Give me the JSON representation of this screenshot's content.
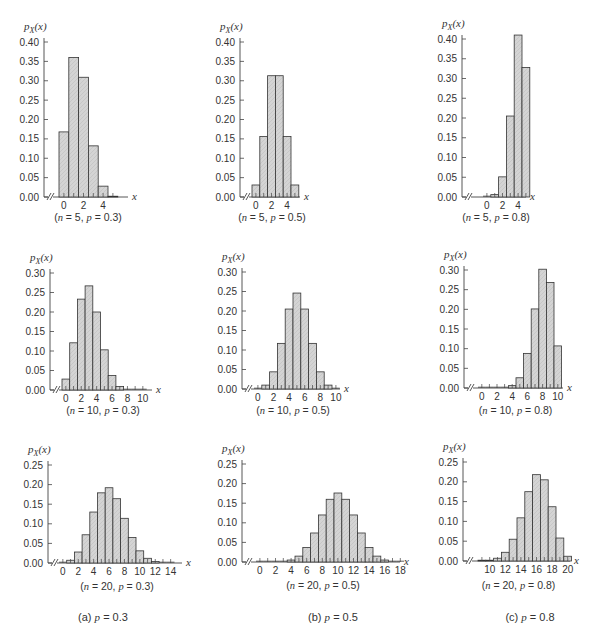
{
  "figure": {
    "y_axis_label": "p_X(x)",
    "x_axis_label": "x",
    "column_captions": [
      "(a) p = 0.3",
      "(b) p = 0.5",
      "(c) p = 0.8"
    ]
  },
  "chart_data": [
    {
      "type": "bar",
      "title": "(n = 5, p = 0.3)",
      "n": 5,
      "p": 0.3,
      "xlabel": "x",
      "ylabel": "p_X(x)",
      "ylim": [
        0,
        0.4
      ],
      "yticks": [
        0,
        0.05,
        0.1,
        0.15,
        0.2,
        0.25,
        0.3,
        0.35,
        0.4
      ],
      "xticks": [
        0,
        2,
        4
      ],
      "x": [
        0,
        1,
        2,
        3,
        4,
        5
      ],
      "values": [
        0.168,
        0.36,
        0.309,
        0.132,
        0.028,
        0.002
      ]
    },
    {
      "type": "bar",
      "title": "(n = 5, p = 0.5)",
      "n": 5,
      "p": 0.5,
      "xlabel": "x",
      "ylabel": "p_X(x)",
      "ylim": [
        0,
        0.4
      ],
      "yticks": [
        0,
        0.05,
        0.1,
        0.15,
        0.2,
        0.25,
        0.3,
        0.35,
        0.4
      ],
      "xticks": [
        0,
        2,
        4
      ],
      "x": [
        0,
        1,
        2,
        3,
        4,
        5
      ],
      "values": [
        0.031,
        0.156,
        0.313,
        0.313,
        0.156,
        0.031
      ]
    },
    {
      "type": "bar",
      "title": "(n = 5, p = 0.8)",
      "n": 5,
      "p": 0.8,
      "xlabel": "x",
      "ylabel": "p_X(x)",
      "ylim": [
        0,
        0.4
      ],
      "yticks": [
        0,
        0.05,
        0.1,
        0.15,
        0.2,
        0.25,
        0.3,
        0.35,
        0.4
      ],
      "xticks": [
        0,
        2,
        4
      ],
      "x": [
        0,
        1,
        2,
        3,
        4,
        5
      ],
      "values": [
        0.0,
        0.006,
        0.051,
        0.205,
        0.41,
        0.328
      ]
    },
    {
      "type": "bar",
      "title": "(n = 10, p = 0.3)",
      "n": 10,
      "p": 0.3,
      "xlabel": "x",
      "ylabel": "p_X(x)",
      "ylim": [
        0,
        0.3
      ],
      "yticks": [
        0,
        0.05,
        0.1,
        0.15,
        0.2,
        0.25,
        0.3
      ],
      "xticks": [
        0,
        2,
        4,
        6,
        8,
        10
      ],
      "x": [
        0,
        1,
        2,
        3,
        4,
        5,
        6,
        7,
        8,
        9,
        10
      ],
      "values": [
        0.028,
        0.121,
        0.233,
        0.267,
        0.2,
        0.103,
        0.037,
        0.009,
        0.001,
        0.0,
        0.0
      ]
    },
    {
      "type": "bar",
      "title": "(n = 10, p = 0.5)",
      "n": 10,
      "p": 0.5,
      "xlabel": "x",
      "ylabel": "p_X(x)",
      "ylim": [
        0,
        0.3
      ],
      "yticks": [
        0,
        0.05,
        0.1,
        0.15,
        0.2,
        0.25,
        0.3
      ],
      "xticks": [
        0,
        2,
        4,
        6,
        8,
        10
      ],
      "x": [
        0,
        1,
        2,
        3,
        4,
        5,
        6,
        7,
        8,
        9,
        10
      ],
      "values": [
        0.001,
        0.01,
        0.044,
        0.117,
        0.205,
        0.246,
        0.205,
        0.117,
        0.044,
        0.01,
        0.001
      ]
    },
    {
      "type": "bar",
      "title": "(n = 10, p = 0.8)",
      "n": 10,
      "p": 0.8,
      "xlabel": "x",
      "ylabel": "p_X(x)",
      "ylim": [
        0,
        0.3
      ],
      "yticks": [
        0,
        0.05,
        0.1,
        0.15,
        0.2,
        0.25,
        0.3
      ],
      "xticks": [
        0,
        2,
        4,
        6,
        8,
        10
      ],
      "x": [
        0,
        1,
        2,
        3,
        4,
        5,
        6,
        7,
        8,
        9,
        10
      ],
      "values": [
        0.0,
        0.0,
        0.0,
        0.001,
        0.006,
        0.026,
        0.088,
        0.201,
        0.302,
        0.268,
        0.107
      ]
    },
    {
      "type": "bar",
      "title": "(n = 20, p = 0.3)",
      "n": 20,
      "p": 0.3,
      "xlabel": "x",
      "ylabel": "p_X(x)",
      "ylim": [
        0,
        0.25
      ],
      "yticks": [
        0,
        0.05,
        0.1,
        0.15,
        0.2,
        0.25
      ],
      "xticks": [
        0,
        2,
        4,
        6,
        8,
        10,
        12,
        14
      ],
      "x": [
        0,
        1,
        2,
        3,
        4,
        5,
        6,
        7,
        8,
        9,
        10,
        11,
        12,
        13,
        14
      ],
      "values": [
        0.001,
        0.007,
        0.028,
        0.072,
        0.13,
        0.179,
        0.192,
        0.164,
        0.114,
        0.065,
        0.031,
        0.012,
        0.004,
        0.001,
        0.0
      ]
    },
    {
      "type": "bar",
      "title": "(n = 20, p = 0.5)",
      "n": 20,
      "p": 0.5,
      "xlabel": "x",
      "ylabel": "p_X(x)",
      "ylim": [
        0,
        0.25
      ],
      "yticks": [
        0,
        0.05,
        0.1,
        0.15,
        0.2,
        0.25
      ],
      "xticks": [
        0,
        2,
        4,
        6,
        8,
        10,
        12,
        14,
        16,
        18
      ],
      "x": [
        0,
        1,
        2,
        3,
        4,
        5,
        6,
        7,
        8,
        9,
        10,
        11,
        12,
        13,
        14,
        15,
        16,
        17,
        18
      ],
      "values": [
        0.0,
        0.0,
        0.0,
        0.001,
        0.005,
        0.015,
        0.037,
        0.074,
        0.12,
        0.16,
        0.176,
        0.16,
        0.12,
        0.074,
        0.037,
        0.015,
        0.005,
        0.001,
        0.0
      ]
    },
    {
      "type": "bar",
      "title": "(n = 20, p = 0.8)",
      "n": 20,
      "p": 0.8,
      "xlabel": "x",
      "ylabel": "p_X(x)",
      "ylim": [
        0,
        0.25
      ],
      "yticks": [
        0,
        0.05,
        0.1,
        0.15,
        0.2,
        0.25
      ],
      "xticks": [
        10,
        12,
        14,
        16,
        18,
        20
      ],
      "x": [
        9,
        10,
        11,
        12,
        13,
        14,
        15,
        16,
        17,
        18,
        19,
        20
      ],
      "values": [
        0.002,
        0.002,
        0.007,
        0.022,
        0.055,
        0.109,
        0.175,
        0.218,
        0.205,
        0.137,
        0.058,
        0.012
      ]
    }
  ],
  "layout": {
    "panels": [
      {
        "axis_x": 44,
        "y0": 197,
        "ytop": 42,
        "first_bar_x": 59,
        "bar_w": 9.8,
        "x_end": 128,
        "caption_y": 221
      },
      {
        "axis_x": 240,
        "y0": 197,
        "ytop": 42,
        "first_bar_x": 252,
        "bar_w": 7.8,
        "x_end": 300,
        "caption_y": 221
      },
      {
        "axis_x": 462,
        "y0": 197,
        "ytop": 39,
        "first_bar_x": 483,
        "bar_w": 7.8,
        "x_end": 526,
        "caption_y": 221
      },
      {
        "axis_x": 50,
        "y0": 390,
        "ytop": 273,
        "first_bar_x": 62,
        "bar_w": 7.7,
        "x_end": 152,
        "caption_y": 414
      },
      {
        "axis_x": 242,
        "y0": 389,
        "ytop": 272,
        "first_bar_x": 254,
        "bar_w": 7.8,
        "x_end": 340,
        "caption_y": 414
      },
      {
        "axis_x": 464,
        "y0": 388,
        "ytop": 270,
        "first_bar_x": 478,
        "bar_w": 7.6,
        "x_end": 563,
        "caption_y": 414
      },
      {
        "axis_x": 48,
        "y0": 563,
        "ytop": 465,
        "first_bar_x": 59,
        "bar_w": 7.7,
        "x_end": 182,
        "caption_y": 590
      },
      {
        "axis_x": 242,
        "y0": 562,
        "ytop": 464,
        "first_bar_x": 256,
        "bar_w": 7.8,
        "x_end": 400,
        "caption_y": 589
      },
      {
        "axis_x": 463,
        "y0": 561,
        "ytop": 462,
        "first_bar_x": 478,
        "bar_w": 7.8,
        "x_end": 570,
        "caption_y": 589
      }
    ],
    "column_caption_y": 621,
    "column_caption_x": [
      103,
      333,
      530
    ]
  }
}
